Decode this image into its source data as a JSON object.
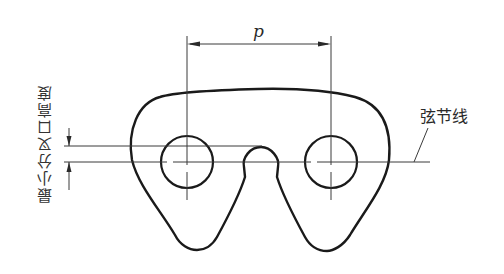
{
  "diagram": {
    "pitch_label": "p",
    "chord_line_label": "弦节线",
    "min_fork_height_label": "最小分叉口高度",
    "colors": {
      "outline": "#1a1a1a",
      "thin": "#3a3a3a",
      "background": "#ffffff"
    }
  }
}
